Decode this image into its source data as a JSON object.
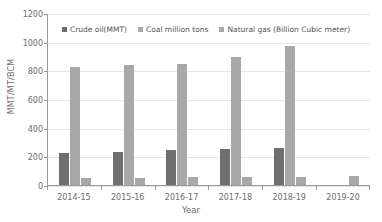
{
  "chart_data": {
    "type": "bar",
    "title": "",
    "xlabel": "Year",
    "ylabel": "MMT/MT/BCM",
    "categories": [
      "2014-15",
      "2015-16",
      "2016-17",
      "2017-18",
      "2018-19",
      "2019-20"
    ],
    "series": [
      {
        "name": "Crude oil(MMT)",
        "color": "#6f6f6f",
        "values": [
          222,
          229,
          243,
          251,
          257,
          null
        ]
      },
      {
        "name": "Coal million tons",
        "color": "#a8a8a8",
        "values": [
          821,
          837,
          843,
          893,
          968,
          null
        ]
      },
      {
        "name": "Natural gas (Billion Cubic meter)",
        "color": "#a8a8a8",
        "values": [
          48,
          49,
          53,
          54,
          56,
          60
        ]
      }
    ],
    "ylim": [
      0,
      1200
    ],
    "yticks": [
      0,
      200,
      400,
      600,
      800,
      1000,
      1200
    ],
    "grid": true,
    "legend_position": "top-inside"
  }
}
